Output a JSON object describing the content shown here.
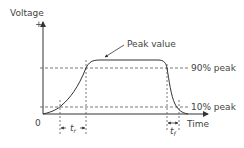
{
  "diagram": {
    "y_axis_label": "Voltage",
    "y_axis_positive": "+",
    "x_axis_label": "Time",
    "origin_label": "0",
    "peak_label": "Peak value",
    "level_90_label": "90% peak",
    "level_10_label": "10% peak",
    "rise_time_label": "t",
    "rise_time_sub": "r",
    "fall_time_label": "t",
    "fall_time_sub": "f",
    "colors": {
      "line": "#333333",
      "dash": "#555555",
      "text": "#444444"
    }
  }
}
